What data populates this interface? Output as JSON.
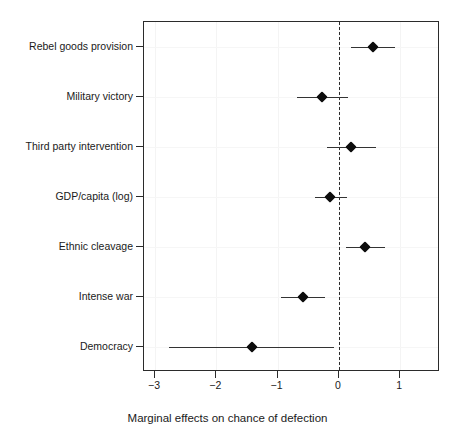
{
  "chart_data": {
    "type": "scatter",
    "subtype": "coefficient-dot-and-whisker-plot",
    "title": "",
    "xlabel": "Marginal effects on chance of defection",
    "ylabel": "",
    "xlim": [
      -3.18,
      1.65
    ],
    "xticks": [
      -3,
      -2,
      -1,
      0,
      1
    ],
    "xticklabels": [
      "−3",
      "−2",
      "−1",
      "0",
      "1"
    ],
    "grid": false,
    "legend": null,
    "reference_line": {
      "x": 0,
      "style": "dashed",
      "color": "#2b2b2b"
    },
    "categories": [
      "Rebel goods provision",
      "Military victory",
      "Third party intervention",
      "GDP/capita (log)",
      "Ethnic cleavage",
      "Intense war",
      "Democracy"
    ],
    "values": [
      0.55,
      -0.27,
      0.2,
      -0.14,
      0.42,
      -0.59,
      -1.42
    ],
    "ci_low": [
      0.19,
      -0.69,
      -0.2,
      -0.39,
      0.11,
      -0.95,
      -2.77
    ],
    "ci_high": [
      0.92,
      0.15,
      0.6,
      0.14,
      0.75,
      -0.22,
      -0.08
    ],
    "points": [
      {
        "label": "Rebel goods provision",
        "estimate": 0.55,
        "ci_low": 0.19,
        "ci_high": 0.92
      },
      {
        "label": "Military victory",
        "estimate": -0.27,
        "ci_low": -0.69,
        "ci_high": 0.15
      },
      {
        "label": "Third party intervention",
        "estimate": 0.2,
        "ci_low": -0.2,
        "ci_high": 0.6
      },
      {
        "label": "GDP/capita (log)",
        "estimate": -0.14,
        "ci_low": -0.39,
        "ci_high": 0.14
      },
      {
        "label": "Ethnic cleavage",
        "estimate": 0.42,
        "ci_low": 0.11,
        "ci_high": 0.75
      },
      {
        "label": "Intense war",
        "estimate": -0.59,
        "ci_low": -0.95,
        "ci_high": -0.22
      },
      {
        "label": "Democracy",
        "estimate": -1.42,
        "ci_low": -2.77,
        "ci_high": -0.08
      }
    ],
    "colors": {
      "point": "#0d0d0d",
      "line": "#333333",
      "axis": "#2b2b2b",
      "background": "#ffffff"
    }
  }
}
